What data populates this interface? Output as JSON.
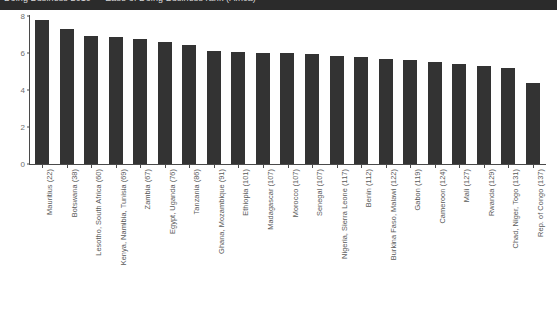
{
  "header": {
    "title": "Doing Business 2010 — Ease of Doing Business rank (Africa)"
  },
  "chart_data": {
    "type": "bar",
    "title": "",
    "xlabel": "",
    "ylabel": "",
    "ylim": [
      0,
      8
    ],
    "yticks": [
      0,
      2,
      4,
      6,
      8
    ],
    "grid": false,
    "legend": "none",
    "bar_color": "#333333",
    "categories": [
      "Mauritius (22)",
      "Botswana (38)",
      "Lesotho, South Africa (60)",
      "Kenya, Namibia, Tunisia (69)",
      "Zambia (67)",
      "Egypt, Uganda (76)",
      "Tanzania (86)",
      "Ghana, Mozambique (91)",
      "Ethiopia (101)",
      "Madagascar (107)",
      "Morocco (107)",
      "Senegal (107)",
      "Nigeria, Sierra Leone (117)",
      "Benin (112)",
      "Burkina Faso, Malawi (122)",
      "Gabon (119)",
      "Cameroon (124)",
      "Mali (127)",
      "Rwanda (129)",
      "Chad, Niger, Togo (131)",
      "Rep. of Congo (137)"
    ],
    "values": [
      7.8,
      7.3,
      6.9,
      6.85,
      6.75,
      6.6,
      6.45,
      6.1,
      6.05,
      6.0,
      6.0,
      5.95,
      5.85,
      5.8,
      5.7,
      5.6,
      5.5,
      5.4,
      5.3,
      5.2,
      4.4
    ]
  }
}
